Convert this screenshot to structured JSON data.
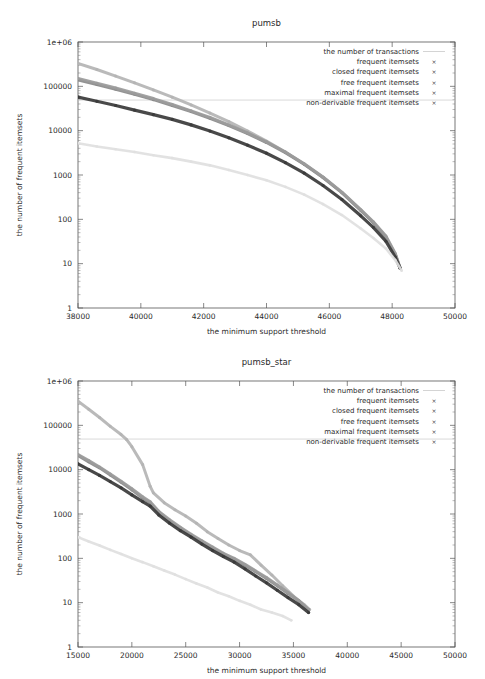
{
  "chart_data": [
    {
      "type": "line",
      "title": "pumsb",
      "xlabel": "the minimum support threshold",
      "ylabel": "the number of frequent itemsets",
      "xlim": [
        38000,
        50000
      ],
      "ylim": [
        1,
        1000000
      ],
      "yscale": "log",
      "xticks": [
        38000,
        40000,
        42000,
        44000,
        46000,
        48000,
        50000
      ],
      "xticklabels": [
        "38000",
        "40000",
        "42000",
        "44000",
        "46000",
        "48000",
        "50000"
      ],
      "yticks": [
        1,
        10,
        100,
        1000,
        10000,
        100000,
        1000000
      ],
      "yticklabels": [
        "1",
        "10",
        "100",
        "1000",
        "10000",
        "100000",
        "1e+06"
      ],
      "grid": false,
      "legend_position": "top-right",
      "series": [
        {
          "name": "the number of transactions",
          "color": "#c9c9c9",
          "marker": "line",
          "x": [
            38000,
            50000
          ],
          "values": [
            49046,
            49046
          ]
        },
        {
          "name": "frequent itemsets",
          "color": "#b4b4b4",
          "marker": "dot",
          "x": [
            38000,
            38600,
            39200,
            39800,
            40400,
            41000,
            41600,
            42200,
            42800,
            43400,
            44000,
            44600,
            45200,
            45800,
            46400,
            47000,
            47400,
            47800,
            48100,
            48250
          ],
          "values": [
            330000,
            240000,
            170000,
            120000,
            83000,
            57000,
            38000,
            25000,
            16000,
            9800,
            5800,
            3300,
            1750,
            880,
            400,
            160,
            85,
            40,
            16,
            8
          ]
        },
        {
          "name": "closed frequent itemsets",
          "color": "#8a8a8a",
          "marker": "x",
          "x": [
            38000,
            38600,
            39200,
            39800,
            40400,
            41000,
            41600,
            42200,
            42800,
            43400,
            44000,
            44600,
            45200,
            45800,
            46400,
            47000,
            47400,
            47800,
            48100,
            48250
          ],
          "values": [
            140000,
            110000,
            86000,
            66000,
            50000,
            37000,
            27000,
            19000,
            13000,
            8600,
            5400,
            3200,
            1750,
            880,
            400,
            160,
            85,
            40,
            16,
            8
          ]
        },
        {
          "name": "free frequent itemsets",
          "color": "#9b9b9b",
          "marker": "dot",
          "x": [
            38000,
            38600,
            39200,
            39800,
            40400,
            41000,
            41600,
            42200,
            42800,
            43400,
            44000,
            44600,
            45200,
            45800,
            46400,
            47000,
            47400,
            47800,
            48100,
            48250
          ],
          "values": [
            150000,
            118000,
            92000,
            70000,
            53000,
            39000,
            28000,
            20000,
            13500,
            8900,
            5600,
            3300,
            1800,
            900,
            410,
            165,
            88,
            42,
            17,
            8
          ]
        },
        {
          "name": "maximal frequent itemsets",
          "color": "#3a3a3a",
          "marker": "dot",
          "x": [
            38000,
            38600,
            39200,
            39800,
            40400,
            41000,
            41600,
            42200,
            42800,
            43400,
            44000,
            44600,
            45200,
            45800,
            46400,
            47000,
            47400,
            47800,
            48100,
            48250
          ],
          "values": [
            57000,
            46000,
            37000,
            29000,
            23000,
            18000,
            13500,
            9800,
            6900,
            4700,
            3100,
            1900,
            1100,
            580,
            280,
            120,
            66,
            32,
            14,
            8
          ]
        },
        {
          "name": "non-derivable frequent itemsets",
          "color": "#e0e0e0",
          "marker": "dot",
          "x": [
            38000,
            38600,
            39200,
            39800,
            40400,
            41000,
            41600,
            42200,
            42800,
            43400,
            44000,
            44600,
            45200,
            45800,
            46400,
            47000,
            47400,
            47800,
            48100,
            48300
          ],
          "values": [
            5200,
            4400,
            3800,
            3300,
            2800,
            2400,
            2000,
            1650,
            1300,
            1000,
            760,
            540,
            360,
            220,
            125,
            62,
            38,
            22,
            12,
            7
          ]
        }
      ]
    },
    {
      "type": "line",
      "title": "pumsb_star",
      "xlabel": "the minimum support threshold",
      "ylabel": "the number of frequent itemsets",
      "xlim": [
        15000,
        50000
      ],
      "ylim": [
        1,
        1000000
      ],
      "yscale": "log",
      "xticks": [
        15000,
        20000,
        25000,
        30000,
        35000,
        40000,
        45000,
        50000
      ],
      "xticklabels": [
        "15000",
        "20000",
        "25000",
        "30000",
        "35000",
        "40000",
        "45000",
        "50000"
      ],
      "yticks": [
        1,
        10,
        100,
        1000,
        10000,
        100000,
        1000000
      ],
      "yticklabels": [
        "1",
        "10",
        "100",
        "1000",
        "10000",
        "100000",
        "1e+06"
      ],
      "grid": false,
      "legend_position": "top-right",
      "series": [
        {
          "name": "the number of transactions",
          "color": "#c9c9c9",
          "marker": "line",
          "x": [
            15000,
            50000
          ],
          "values": [
            49046,
            49046
          ]
        },
        {
          "name": "frequent itemsets",
          "color": "#b4b4b4",
          "marker": "dot",
          "x": [
            15000,
            16000,
            17000,
            18000,
            19000,
            19500,
            20000,
            21000,
            21700,
            22000,
            23000,
            24000,
            25000,
            26000,
            27000,
            28000,
            29000,
            30000,
            31000,
            32000,
            33000,
            34000,
            35000,
            36000,
            36500
          ],
          "values": [
            350000,
            230000,
            150000,
            95000,
            62000,
            48000,
            33000,
            13000,
            4200,
            3000,
            1800,
            1250,
            900,
            620,
            400,
            280,
            200,
            150,
            120,
            70,
            42,
            24,
            14,
            9,
            7
          ]
        },
        {
          "name": "closed frequent itemsets",
          "color": "#8a8a8a",
          "marker": "x",
          "x": [
            15000,
            16000,
            17000,
            18000,
            19000,
            20000,
            21000,
            21700,
            22500,
            23500,
            24500,
            25500,
            26500,
            27500,
            28500,
            29500,
            30500,
            31500,
            32500,
            33500,
            34500,
            35500,
            36400
          ],
          "values": [
            21000,
            15000,
            11000,
            7600,
            5200,
            3500,
            2300,
            1800,
            1100,
            700,
            480,
            330,
            240,
            170,
            125,
            95,
            70,
            50,
            35,
            24,
            16,
            11,
            7
          ]
        },
        {
          "name": "free frequent itemsets",
          "color": "#9b9b9b",
          "marker": "dot",
          "x": [
            15000,
            16000,
            17000,
            18000,
            19000,
            20000,
            21000,
            21700,
            22500,
            23500,
            24500,
            25500,
            26500,
            27500,
            28500,
            29500,
            30500,
            31500,
            32500,
            33500,
            34500,
            35500,
            36400
          ],
          "values": [
            22000,
            16000,
            11500,
            8000,
            5500,
            3700,
            2450,
            1900,
            1150,
            740,
            500,
            350,
            250,
            180,
            130,
            100,
            73,
            52,
            37,
            25,
            17,
            11,
            7
          ]
        },
        {
          "name": "maximal frequent itemsets",
          "color": "#3a3a3a",
          "marker": "dot",
          "x": [
            15000,
            16000,
            17000,
            18000,
            19000,
            20000,
            21000,
            21700,
            22500,
            23500,
            24500,
            25500,
            26500,
            27500,
            28500,
            29500,
            30500,
            31500,
            32500,
            33500,
            34500,
            35500,
            36400
          ],
          "values": [
            13500,
            10000,
            7400,
            5400,
            3900,
            2700,
            1900,
            1500,
            950,
            620,
            420,
            300,
            210,
            150,
            110,
            82,
            58,
            40,
            28,
            19,
            13,
            9,
            6
          ]
        },
        {
          "name": "non-derivable frequent itemsets",
          "color": "#e0e0e0",
          "marker": "dot",
          "x": [
            15000,
            16000,
            17000,
            18000,
            19000,
            20000,
            21000,
            22000,
            23000,
            24000,
            25000,
            26000,
            27000,
            28000,
            29000,
            30000,
            31000,
            32000,
            33000,
            34000,
            34800
          ],
          "values": [
            300,
            240,
            195,
            155,
            125,
            100,
            82,
            66,
            53,
            43,
            34,
            27,
            22,
            17,
            14,
            11,
            9,
            7,
            6,
            5,
            4
          ]
        }
      ]
    }
  ]
}
